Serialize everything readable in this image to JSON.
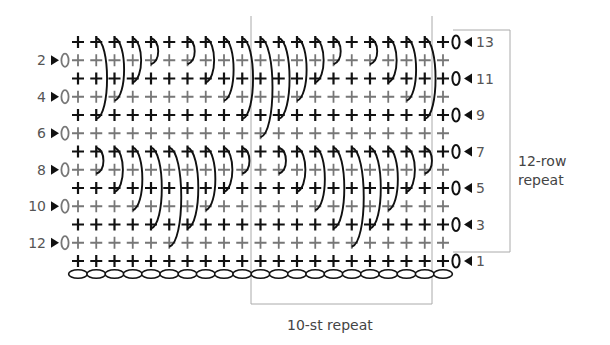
{
  "diagram": {
    "type": "crochet-stitch-chart",
    "columns": 21,
    "rows": 13,
    "foundation_chain_count": 21,
    "row_labels_left": [
      "12",
      "10",
      "8",
      "6",
      "4",
      "2"
    ],
    "row_labels_right": [
      "13",
      "11",
      "9",
      "7",
      "5",
      "3",
      "1"
    ],
    "even_rows_direction": "right-to-left (arrow pointing right on left side)",
    "odd_rows_direction": "left-to-right (arrow pointing left on right side)",
    "turning_chain_symbol": "0",
    "stitch_symbol": "+",
    "colors": {
      "odd_row_stitch": "#111111",
      "even_row_stitch": "#777777",
      "long_stitch": "#111111",
      "bracket": "#aaaaaa",
      "label": "#555555"
    },
    "long_stitches": [
      {
        "row": 7,
        "col": 2,
        "depth": 1
      },
      {
        "row": 7,
        "col": 3,
        "depth": 2
      },
      {
        "row": 7,
        "col": 4,
        "depth": 3
      },
      {
        "row": 7,
        "col": 5,
        "depth": 4
      },
      {
        "row": 7,
        "col": 6,
        "depth": 5
      },
      {
        "row": 7,
        "col": 7,
        "depth": 4
      },
      {
        "row": 7,
        "col": 8,
        "depth": 3
      },
      {
        "row": 7,
        "col": 9,
        "depth": 2
      },
      {
        "row": 7,
        "col": 10,
        "depth": 1
      },
      {
        "row": 7,
        "col": 12,
        "depth": 1
      },
      {
        "row": 7,
        "col": 13,
        "depth": 2
      },
      {
        "row": 7,
        "col": 14,
        "depth": 3
      },
      {
        "row": 7,
        "col": 15,
        "depth": 4
      },
      {
        "row": 7,
        "col": 16,
        "depth": 5
      },
      {
        "row": 7,
        "col": 17,
        "depth": 4
      },
      {
        "row": 7,
        "col": 18,
        "depth": 3
      },
      {
        "row": 7,
        "col": 19,
        "depth": 2
      },
      {
        "row": 7,
        "col": 20,
        "depth": 1
      },
      {
        "row": 13,
        "col": 2,
        "depth": 4
      },
      {
        "row": 13,
        "col": 3,
        "depth": 3
      },
      {
        "row": 13,
        "col": 4,
        "depth": 2
      },
      {
        "row": 13,
        "col": 5,
        "depth": 1
      },
      {
        "row": 13,
        "col": 7,
        "depth": 1
      },
      {
        "row": 13,
        "col": 8,
        "depth": 2
      },
      {
        "row": 13,
        "col": 9,
        "depth": 3
      },
      {
        "row": 13,
        "col": 10,
        "depth": 4
      },
      {
        "row": 13,
        "col": 11,
        "depth": 5
      },
      {
        "row": 13,
        "col": 12,
        "depth": 4
      },
      {
        "row": 13,
        "col": 13,
        "depth": 3
      },
      {
        "row": 13,
        "col": 14,
        "depth": 2
      },
      {
        "row": 13,
        "col": 15,
        "depth": 1
      },
      {
        "row": 13,
        "col": 17,
        "depth": 1
      },
      {
        "row": 13,
        "col": 18,
        "depth": 2
      },
      {
        "row": 13,
        "col": 19,
        "depth": 3
      },
      {
        "row": 13,
        "col": 20,
        "depth": 4
      }
    ]
  },
  "annotations": {
    "row_repeat_label_line1": "12-row",
    "row_repeat_label_line2": "repeat",
    "stitch_repeat_label": "10-st repeat"
  }
}
